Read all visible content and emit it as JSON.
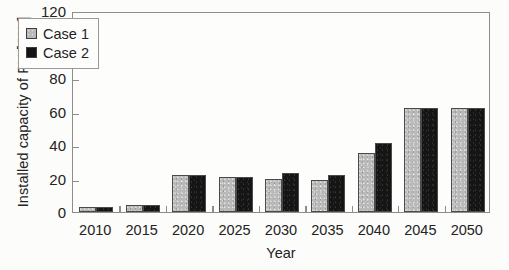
{
  "chart_data": {
    "type": "bar",
    "title": "",
    "subtitle": "",
    "xlabel": "Year",
    "ylabel": "Installed capacity of PV [GW]",
    "categories": [
      "2010",
      "2015",
      "2020",
      "2025",
      "2030",
      "2035",
      "2040",
      "2045",
      "2050"
    ],
    "series": [
      {
        "name": "Case 1",
        "color": "#b9b9b9",
        "values": [
          3,
          4,
          22,
          21,
          20,
          19,
          35,
          62,
          62
        ]
      },
      {
        "name": "Case 2",
        "color": "#141414",
        "values": [
          3,
          4,
          22,
          21,
          23,
          22,
          41,
          62,
          62
        ]
      }
    ],
    "ylim": [
      0,
      120
    ],
    "yticks": [
      0,
      20,
      40,
      60,
      80,
      100,
      120
    ],
    "ytick_labels": [
      "0",
      "20",
      "40",
      "60",
      "80",
      "100",
      "120"
    ],
    "grid": false,
    "legend_position": "upper left",
    "legend_entries": [
      "Case 1",
      "Case 2"
    ]
  }
}
